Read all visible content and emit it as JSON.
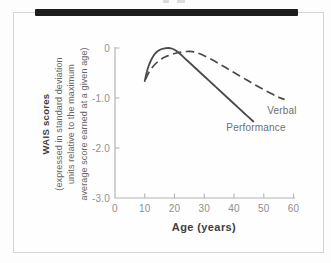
{
  "figure": {
    "top_rule_color": "#1d1d1d",
    "frame_border_color": "#d4d4d4"
  },
  "chart_data": {
    "type": "line",
    "title": "",
    "xlabel": "Age (years)",
    "ylabel_lines": {
      "0": "WAIS scores",
      "1": "(expressed in standard deviation",
      "2": "units relative to the maximum",
      "3": "average score earned at a given age)"
    },
    "xlim": [
      0,
      60
    ],
    "ylim": [
      -3,
      0
    ],
    "x_ticks": [
      0,
      10,
      20,
      30,
      40,
      50,
      60
    ],
    "y_ticks": [
      0,
      -1,
      -2
    ],
    "y_tick_entries": [
      {
        "value": 0,
        "label": "0"
      },
      {
        "value": -1,
        "label": "-1.0"
      },
      {
        "value": -2,
        "label": "-2.0"
      },
      {
        "value": -3,
        "label": "-3.0"
      }
    ],
    "grid": false,
    "legend": "inline-labels",
    "colors": {
      "line": "#4a4a4a",
      "axis": "#b3b3b3",
      "tick_label": "#8f8f8f",
      "series_label": "#6f6f6f",
      "axis_title": "#3e3e3e"
    },
    "series": [
      {
        "name": "Performance",
        "line_style": "solid",
        "peak_age": 18,
        "points": [
          [
            10,
            -0.66
          ],
          [
            10.6,
            -0.5
          ],
          [
            11.3,
            -0.36
          ],
          [
            12,
            -0.26
          ],
          [
            13,
            -0.15
          ],
          [
            14,
            -0.08
          ],
          [
            15,
            -0.04
          ],
          [
            16,
            -0.015
          ],
          [
            17,
            -0.005
          ],
          [
            18,
            0.0
          ],
          [
            19,
            -0.01
          ],
          [
            20,
            -0.035
          ],
          [
            21,
            -0.075
          ],
          [
            22,
            -0.125
          ],
          [
            24,
            -0.235
          ],
          [
            26,
            -0.345
          ],
          [
            28,
            -0.455
          ],
          [
            30,
            -0.565
          ],
          [
            33,
            -0.73
          ],
          [
            36,
            -0.895
          ],
          [
            40,
            -1.115
          ],
          [
            43,
            -1.28
          ],
          [
            46.5,
            -1.47
          ]
        ]
      },
      {
        "name": "Verbal",
        "line_style": "dashed",
        "peak_age": 25,
        "points": [
          [
            10.3,
            -0.63
          ],
          [
            11,
            -0.53
          ],
          [
            12,
            -0.43
          ],
          [
            13,
            -0.355
          ],
          [
            14,
            -0.295
          ],
          [
            15,
            -0.245
          ],
          [
            16,
            -0.205
          ],
          [
            17,
            -0.175
          ],
          [
            18,
            -0.15
          ],
          [
            19,
            -0.125
          ],
          [
            20,
            -0.11
          ],
          [
            21,
            -0.095
          ],
          [
            22,
            -0.085
          ],
          [
            23,
            -0.075
          ],
          [
            24,
            -0.07
          ],
          [
            25,
            -0.068
          ],
          [
            26,
            -0.072
          ],
          [
            27,
            -0.085
          ],
          [
            28,
            -0.105
          ],
          [
            30,
            -0.155
          ],
          [
            32,
            -0.215
          ],
          [
            34,
            -0.28
          ],
          [
            36,
            -0.35
          ],
          [
            38,
            -0.42
          ],
          [
            40,
            -0.49
          ],
          [
            43,
            -0.595
          ],
          [
            46,
            -0.7
          ],
          [
            49,
            -0.8
          ],
          [
            52,
            -0.895
          ],
          [
            55,
            -0.985
          ],
          [
            57,
            -1.03
          ]
        ]
      }
    ]
  }
}
